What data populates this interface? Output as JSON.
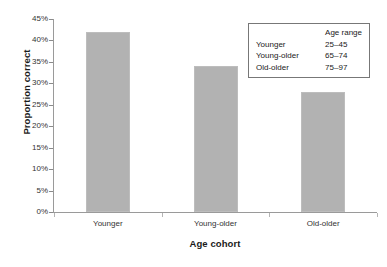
{
  "chart_data": {
    "type": "bar",
    "title": "",
    "categories": [
      "Younger",
      "Young-older",
      "Old-older"
    ],
    "values": [
      42,
      34,
      28
    ],
    "value_labels": [
      "42%",
      "34%",
      "28%"
    ],
    "xlabel": "Age cohort",
    "ylabel": "Proportion correct",
    "ylim": [
      0,
      45
    ],
    "ytick_step": 5,
    "ytick_labels": [
      "0%",
      "5%",
      "10%",
      "15%",
      "20%",
      "25%",
      "30%",
      "35%",
      "40%",
      "45%"
    ],
    "ytick_values": [
      0,
      5,
      10,
      15,
      20,
      25,
      30,
      35,
      40,
      45
    ],
    "grid": false,
    "legend_position": "top-right",
    "bar_color": "#b2b2b2",
    "axis_color": "#9a9a9a",
    "background_color": "#ffffff"
  },
  "legend": {
    "header_blank": "",
    "header_range": "Age range",
    "rows": [
      {
        "name": "Younger",
        "range": "25–45"
      },
      {
        "name": "Young-older",
        "range": "65–74"
      },
      {
        "name": "Old-older",
        "range": "75–97"
      }
    ]
  },
  "caption": {
    "remnant": ""
  }
}
